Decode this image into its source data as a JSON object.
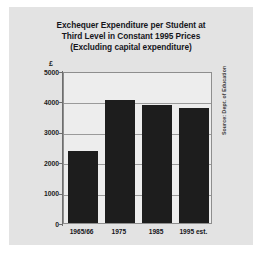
{
  "figure": {
    "source_note": "Source: Dept. of Education",
    "currency_symbol": "£",
    "card_color": "#e3e3e3",
    "bar_color": "#1d1d1d",
    "grid_color": "#9a9a9a",
    "plot_background": "#ededed"
  },
  "chart_data": {
    "type": "bar",
    "title": "Exchequer Expenditure per Student at Third Level in Constant 1995 Prices (Excluding capital expenditure)",
    "title_lines": [
      "Exchequer Expenditure per Student at",
      "Third Level in Constant 1995 Prices",
      "(Excluding capital expenditure)"
    ],
    "categories": [
      "1965/66",
      "1975",
      "1985",
      "1995 est."
    ],
    "values": [
      2380,
      4060,
      3880,
      3770
    ],
    "xlabel": "",
    "ylabel": "£",
    "ylim": [
      0,
      5000
    ],
    "yticks": [
      5000,
      4000,
      3000,
      2000,
      1000,
      0
    ],
    "ytick_labels": [
      "5000",
      "4000",
      "3000",
      "2000",
      "1000",
      "0"
    ],
    "grid": true,
    "legend": "none",
    "annotations": [
      "Source: Dept. of Education"
    ]
  }
}
